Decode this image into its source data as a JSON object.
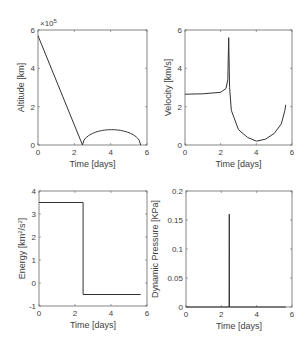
{
  "chart_data": [
    {
      "type": "line",
      "title": "",
      "xlabel": "Time [days]",
      "ylabel": "Altitude [km]",
      "y_exponent": "×10⁵",
      "xlim": [
        0,
        6
      ],
      "ylim": [
        0,
        6
      ],
      "xticks": [
        "0",
        "2",
        "4",
        "6"
      ],
      "yticks": [
        "0",
        "2",
        "4",
        "6"
      ],
      "series": [
        {
          "name": "altitude",
          "x": [
            0,
            2.45,
            2.5,
            3.0,
            3.5,
            4.0,
            4.5,
            5.0,
            5.5,
            5.65
          ],
          "y": [
            5.7,
            0,
            0.15,
            0.55,
            0.75,
            0.8,
            0.75,
            0.58,
            0.2,
            0
          ]
        }
      ],
      "grid": false
    },
    {
      "type": "line",
      "title": "",
      "xlabel": "Time [days]",
      "ylabel": "Velocity [km/s]",
      "xlim": [
        0,
        6
      ],
      "ylim": [
        0,
        6
      ],
      "xticks": [
        "0",
        "2",
        "4",
        "6"
      ],
      "yticks": [
        "0",
        "2",
        "4",
        "6"
      ],
      "series": [
        {
          "name": "velocity",
          "x": [
            0,
            1.0,
            2.0,
            2.3,
            2.4,
            2.45,
            2.5,
            2.6,
            3.0,
            3.5,
            4.0,
            4.5,
            5.0,
            5.4,
            5.6,
            5.65
          ],
          "y": [
            2.65,
            2.67,
            2.75,
            2.95,
            3.4,
            5.6,
            3.0,
            1.8,
            0.8,
            0.4,
            0.2,
            0.3,
            0.6,
            1.1,
            1.8,
            2.1
          ]
        }
      ],
      "grid": false
    },
    {
      "type": "line",
      "title": "",
      "xlabel": "Time [days]",
      "ylabel": "Energy [km²/s²]",
      "xlim": [
        0,
        6
      ],
      "ylim": [
        -1,
        4
      ],
      "xticks": [
        "0",
        "2",
        "4",
        "6"
      ],
      "yticks": [
        "-1",
        "0",
        "1",
        "2",
        "3",
        "4"
      ],
      "series": [
        {
          "name": "energy",
          "x": [
            0,
            2.45,
            2.45,
            5.65
          ],
          "y": [
            3.5,
            3.5,
            -0.5,
            -0.5
          ]
        }
      ],
      "grid": false
    },
    {
      "type": "line",
      "title": "",
      "xlabel": "Time [days]",
      "ylabel": "Dynamic Pressure [KPa]",
      "xlim": [
        0,
        6
      ],
      "ylim": [
        0,
        0.2
      ],
      "xticks": [
        "0",
        "2",
        "4",
        "6"
      ],
      "yticks": [
        "0",
        "0.05",
        "0.1",
        "0.15",
        "0.2"
      ],
      "series": [
        {
          "name": "dynamic_pressure",
          "x": [
            0,
            2.44,
            2.45,
            2.46,
            5.65
          ],
          "y": [
            0,
            0,
            0.16,
            0,
            0
          ]
        }
      ],
      "grid": false
    }
  ],
  "plots": {
    "altitude": {
      "xlabel": "Time [days]",
      "ylabel": "Altitude [km]",
      "exponent": "×10",
      "exponent_power": "5"
    },
    "velocity": {
      "xlabel": "Time [days]",
      "ylabel": "Velocity [km/s]"
    },
    "energy": {
      "xlabel": "Time [days]",
      "ylabel_pre": "Energy [km",
      "ylabel_sup1": "2",
      "ylabel_mid": "/s",
      "ylabel_sup2": "2",
      "ylabel_post": "]"
    },
    "pressure": {
      "xlabel": "Time [days]",
      "ylabel": "Dynamic Pressure [KPa]"
    }
  },
  "colors": {
    "line": "#333333",
    "axis": "#666666",
    "text": "#404040"
  }
}
